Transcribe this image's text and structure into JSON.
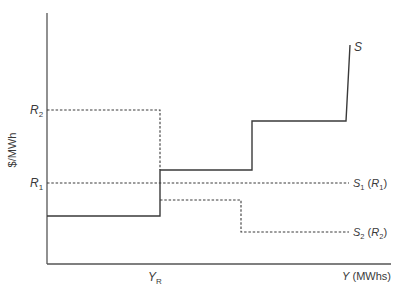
{
  "diagram": {
    "title": "",
    "y_axis_label": "$/MWh",
    "x_axis_label": "Y (MWhs)",
    "x_axis_label_var": "Y",
    "x_axis_label_unit": " (MWhs)",
    "x_tick_label": "Y",
    "x_tick_label_sub": "R",
    "y_tick_labels": [
      {
        "main": "R",
        "sub": "2"
      },
      {
        "main": "R",
        "sub": "1"
      }
    ],
    "curves": [
      {
        "name": "S",
        "style": "solid",
        "label": "S"
      },
      {
        "name": "S1 (R1)",
        "style": "dashed",
        "label_main": "S",
        "label_sub": "1",
        "label_paren_main": "R",
        "label_paren_sub": "1"
      },
      {
        "name": "S2 (R2)",
        "style": "dashed",
        "label_main": "S",
        "label_sub": "2",
        "label_paren_main": "R",
        "label_paren_sub": "2"
      }
    ],
    "colors": {
      "line": "#3a3a3a",
      "text": "#3a3a3a",
      "background": "#ffffff"
    }
  }
}
